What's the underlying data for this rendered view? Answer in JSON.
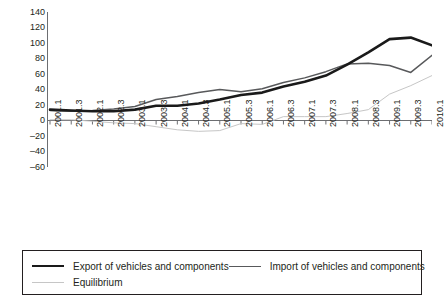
{
  "chart_data": {
    "type": "line",
    "title": "",
    "xlabel": "",
    "ylabel": "",
    "ylim": [
      -60,
      140
    ],
    "ytick_step": 20,
    "yticks": [
      140,
      120,
      100,
      80,
      60,
      40,
      20,
      0,
      -20,
      -40,
      -60
    ],
    "grid": false,
    "legend_position": "bottom",
    "categories": [
      "2001.1",
      "2001.3",
      "2002.1",
      "2002.3",
      "2003.1",
      "2003.3",
      "2004.1",
      "2004.3",
      "2005.1",
      "2005.3",
      "2006.1",
      "2006.3",
      "2007.1",
      "2007.3",
      "2008.1",
      "2008.3",
      "2009.1",
      "2009.3",
      "2010.1"
    ],
    "series": [
      {
        "name": "Export of vehicles and components",
        "color": "#1a1a1a",
        "width": 2.6,
        "values": [
          14,
          13,
          12,
          12,
          14,
          19,
          19,
          22,
          27,
          33,
          36,
          44,
          50,
          58,
          72,
          88,
          105,
          107,
          97
        ]
      },
      {
        "name": "Import of vehicles and components",
        "color": "#58595b",
        "width": 1.5,
        "values": [
          13,
          12,
          13,
          15,
          18,
          27,
          31,
          36,
          40,
          37,
          41,
          49,
          55,
          63,
          73,
          74,
          71,
          62,
          84
        ]
      },
      {
        "name": "Equilibrium",
        "color": "#c6c6c6",
        "width": 1.0,
        "values": [
          1,
          1,
          -1,
          -3,
          -4,
          -8,
          -12,
          -14,
          -13,
          -4,
          -5,
          5,
          5,
          5,
          9,
          14,
          34,
          45,
          58
        ]
      }
    ],
    "series_detailed": {
      "note": "Values read against y-axis gridlines at 20-unit intervals across 19 half-year periods",
      "export": [
        14,
        13,
        12,
        12,
        14,
        19,
        19,
        22,
        27,
        33,
        36,
        44,
        50,
        58,
        72,
        88,
        105,
        107,
        97
      ],
      "import": [
        13,
        12,
        13,
        15,
        18,
        27,
        31,
        36,
        40,
        37,
        41,
        49,
        55,
        63,
        73,
        74,
        71,
        62,
        84
      ],
      "equilibrium": [
        1,
        1,
        -1,
        -3,
        -4,
        -8,
        -12,
        -14,
        -13,
        -4,
        -5,
        5,
        5,
        5,
        9,
        14,
        34,
        45,
        58
      ]
    }
  },
  "legend": {
    "export_label": "Export of vehicles and components",
    "import_label": "Import of vehicles and components",
    "equilibrium_label": "Equilibrium"
  },
  "colors": {
    "export": "#1a1a1a",
    "import": "#58595b",
    "equilibrium": "#c6c6c6",
    "axis": "#6d6e71",
    "text": "#231f20",
    "background": "#ffffff"
  }
}
